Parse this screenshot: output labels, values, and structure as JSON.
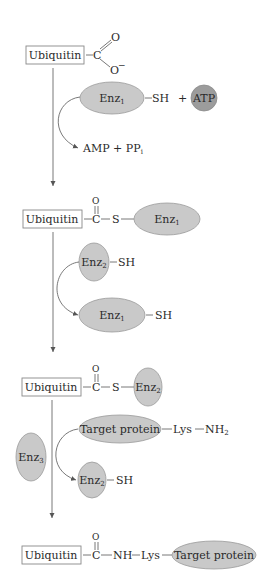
{
  "diagram": {
    "step1": {
      "ubiquitin_label": "Ubiquitin",
      "carbon": "C",
      "oxygen": "O",
      "oxide": "O",
      "oxide_charge": "−",
      "enzyme": "Enz",
      "enzyme_sub": "1",
      "sh": "SH",
      "plus": "+",
      "atp": "ATP",
      "byproduct": "AMP + PP",
      "byproduct_sub": "i"
    },
    "step2": {
      "ubiquitin_label": "Ubiquitin",
      "oxygen": "O",
      "carbon": "C",
      "sulfur": "S",
      "enzyme": "Enz",
      "enzyme_sub": "1",
      "incoming_enzyme": "Enz",
      "incoming_enzyme_sub": "2",
      "incoming_sh": "SH",
      "released_enzyme": "Enz",
      "released_enzyme_sub": "1",
      "released_sh": "SH"
    },
    "step3": {
      "ubiquitin_label": "Ubiquitin",
      "oxygen": "O",
      "carbon": "C",
      "sulfur": "S",
      "enzyme": "Enz",
      "enzyme_sub": "2",
      "target": "Target protein",
      "lys": "Lys",
      "nh2": "NH",
      "nh2_sub": "2",
      "ligase": "Enz",
      "ligase_sub": "3",
      "released_enzyme": "Enz",
      "released_enzyme_sub": "2",
      "released_sh": "SH"
    },
    "step4": {
      "ubiquitin_label": "Ubiquitin",
      "oxygen": "O",
      "carbon": "C",
      "nh": "NH",
      "lys": "Lys",
      "target": "Target protein"
    },
    "colors": {
      "enzyme_fill": "#c9c9c9",
      "atp_fill": "#9c9c9c",
      "line": "#6a6a6a"
    }
  }
}
